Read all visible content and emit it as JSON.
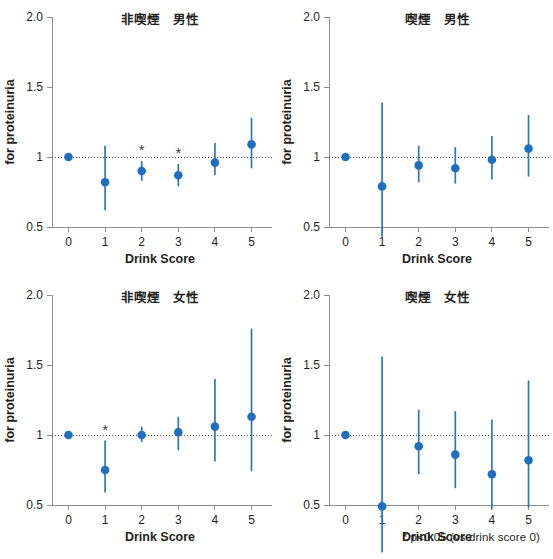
{
  "figure": {
    "footnote": "* p<0.05 (vs drink score 0)",
    "marker_color": "#1f6fc0",
    "errorbar_color": "#2c77b8",
    "axis_color": "#8d8d8d",
    "reference_line_value": 1.0
  },
  "chart_data": [
    {
      "type": "scatter",
      "panel_index": 0,
      "title": "非喫煙　男性",
      "xlabel": "Drink Score",
      "ylabel": "for proteinuria",
      "xlim": [
        -0.45,
        5.45
      ],
      "ylim": [
        0.5,
        2.0
      ],
      "ytick_values": [
        0.5,
        1.0,
        1.5,
        2.0
      ],
      "ytick_labels": [
        "0.5",
        "1",
        "1.5",
        "2.0"
      ],
      "xtick_values": [
        0,
        1,
        2,
        3,
        4,
        5
      ],
      "xtick_labels": [
        "0",
        "1",
        "2",
        "3",
        "4",
        "5"
      ],
      "grid": false,
      "legend": "none",
      "categories": [
        "0",
        "1",
        "2",
        "3",
        "4",
        "5"
      ],
      "values": [
        1.0,
        0.82,
        0.9,
        0.87,
        0.96,
        1.09
      ],
      "ci_lower": [
        1.0,
        0.62,
        0.83,
        0.79,
        0.87,
        0.92
      ],
      "ci_upper": [
        1.0,
        1.08,
        0.97,
        0.95,
        1.1,
        1.28
      ],
      "significant": [
        false,
        false,
        true,
        true,
        false,
        false
      ],
      "star_marks": [
        "",
        "",
        "*",
        "*",
        "",
        ""
      ]
    },
    {
      "type": "scatter",
      "panel_index": 1,
      "title": "喫煙　男性",
      "xlabel": "Drink Score",
      "ylabel": "for proteinuria",
      "xlim": [
        -0.45,
        5.45
      ],
      "ylim": [
        0.5,
        2.0
      ],
      "ytick_values": [
        0.5,
        1.0,
        1.5,
        2.0
      ],
      "ytick_labels": [
        "0.5",
        "1",
        "1.5",
        "2.0"
      ],
      "xtick_values": [
        0,
        1,
        2,
        3,
        4,
        5
      ],
      "xtick_labels": [
        "0",
        "1",
        "2",
        "3",
        "4",
        "5"
      ],
      "grid": false,
      "legend": "none",
      "categories": [
        "0",
        "1",
        "2",
        "3",
        "4",
        "5"
      ],
      "values": [
        1.0,
        0.79,
        0.94,
        0.92,
        0.98,
        1.06
      ],
      "ci_lower": [
        1.0,
        0.43,
        0.82,
        0.81,
        0.84,
        0.86
      ],
      "ci_upper": [
        1.0,
        1.39,
        1.08,
        1.07,
        1.15,
        1.3
      ],
      "significant": [
        false,
        false,
        false,
        false,
        false,
        false
      ],
      "star_marks": [
        "",
        "",
        "",
        "",
        "",
        ""
      ]
    },
    {
      "type": "scatter",
      "panel_index": 2,
      "title": "非喫煙　女性",
      "xlabel": "Drink Score",
      "ylabel": "for proteinuria",
      "xlim": [
        -0.45,
        5.45
      ],
      "ylim": [
        0.5,
        2.0
      ],
      "ytick_values": [
        0.5,
        1.0,
        1.5,
        2.0
      ],
      "ytick_labels": [
        "0.5",
        "1",
        "1.5",
        "2.0"
      ],
      "xtick_values": [
        0,
        1,
        2,
        3,
        4,
        5
      ],
      "xtick_labels": [
        "0",
        "1",
        "2",
        "3",
        "4",
        "5"
      ],
      "grid": false,
      "legend": "none",
      "categories": [
        "0",
        "1",
        "2",
        "3",
        "4",
        "5"
      ],
      "values": [
        1.0,
        0.75,
        1.0,
        1.02,
        1.06,
        1.13
      ],
      "ci_lower": [
        1.0,
        0.59,
        0.95,
        0.89,
        0.81,
        0.74
      ],
      "ci_upper": [
        1.0,
        0.96,
        1.06,
        1.13,
        1.4,
        1.76
      ],
      "significant": [
        false,
        true,
        false,
        false,
        false,
        false
      ],
      "star_marks": [
        "",
        "*",
        "",
        "",
        "",
        ""
      ]
    },
    {
      "type": "scatter",
      "panel_index": 3,
      "title": "喫煙　女性",
      "xlabel": "Drink Score",
      "ylabel": "for proteinuria",
      "xlim": [
        -0.45,
        5.45
      ],
      "ylim": [
        0.5,
        2.0
      ],
      "ytick_values": [
        0.5,
        1.0,
        1.5,
        2.0
      ],
      "ytick_labels": [
        "0.5",
        "1",
        "1.5",
        "2.0"
      ],
      "xtick_values": [
        0,
        1,
        2,
        3,
        4,
        5
      ],
      "xtick_labels": [
        "0",
        "1",
        "2",
        "3",
        "4",
        "5"
      ],
      "grid": false,
      "legend": "none",
      "categories": [
        "0",
        "1",
        "2",
        "3",
        "4",
        "5"
      ],
      "values": [
        1.0,
        0.49,
        0.92,
        0.86,
        0.72,
        0.82
      ],
      "ci_lower": [
        1.0,
        0.16,
        0.72,
        0.62,
        0.47,
        0.48
      ],
      "ci_upper": [
        1.0,
        1.56,
        1.18,
        1.17,
        1.11,
        1.39
      ],
      "significant": [
        false,
        false,
        false,
        false,
        false,
        false
      ],
      "star_marks": [
        "",
        "",
        "",
        "",
        "",
        ""
      ]
    }
  ]
}
